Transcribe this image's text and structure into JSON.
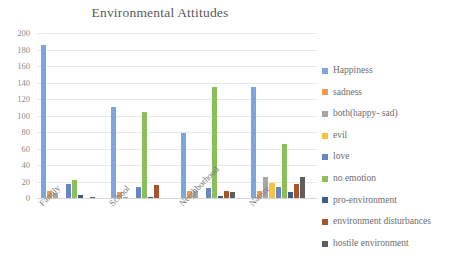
{
  "chart_data": {
    "type": "bar",
    "title": "Environmental Attitudes",
    "xlabel": "",
    "ylabel": "",
    "ylim": [
      0,
      200
    ],
    "ytick_step": 20,
    "yticks": [
      0,
      20,
      40,
      60,
      80,
      100,
      120,
      140,
      160,
      180,
      200
    ],
    "grid": true,
    "grid_axis": "y",
    "legend_position": "right",
    "categories": [
      "Family",
      "School",
      "Neighborhood",
      "Nature"
    ],
    "series": [
      {
        "name": "Happiness",
        "color": "#7CA6DC",
        "values": [
          186,
          110,
          79,
          134
        ]
      },
      {
        "name": "sadness",
        "color": "#ED9A52",
        "values": [
          8,
          7,
          8,
          9
        ]
      },
      {
        "name": "both(happy- sad)",
        "color": "#A6A6A6",
        "values": [
          6,
          1,
          9,
          25
        ]
      },
      {
        "name": "evil",
        "color": "#F5C242",
        "values": [
          0,
          0,
          0,
          18
        ]
      },
      {
        "name": "love",
        "color": "#6B84C4",
        "values": [
          17,
          13,
          12,
          13
        ]
      },
      {
        "name": "no emotion",
        "color": "#8BBF5C",
        "values": [
          22,
          104,
          134,
          66
        ]
      },
      {
        "name": "pro-environment",
        "color": "#3E5C8A",
        "values": [
          4,
          1,
          2,
          7
        ]
      },
      {
        "name": "environment disturbances",
        "color": "#A8542B",
        "values": [
          0,
          16,
          9,
          17
        ]
      },
      {
        "name": "hostile environment",
        "color": "#5E5E5E",
        "values": [
          1,
          0,
          7,
          25
        ]
      }
    ]
  },
  "colors": {
    "background": "#ffffff",
    "title_text": "#595959",
    "tick_text": "#8a8a8a",
    "category_text": "#7a7a7a",
    "legend_text": "#6d6d6d",
    "gridline": "#e8e8e8"
  }
}
